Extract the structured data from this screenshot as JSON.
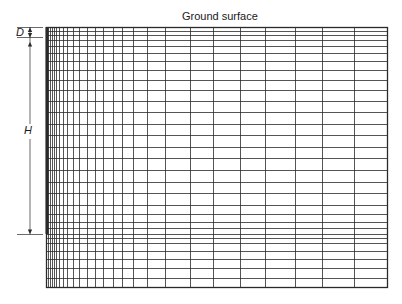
{
  "diagram": {
    "title_label": "Ground surface",
    "dimension_labels": {
      "D": "D",
      "H": "H"
    },
    "mesh": {
      "left": 46,
      "right": 387,
      "top": 27,
      "bottom": 287,
      "vertical_lines_x": [
        48,
        50,
        52,
        54,
        56,
        59,
        63,
        67,
        73,
        79,
        87,
        95,
        103,
        113,
        122,
        133,
        147,
        165,
        190,
        213,
        240,
        265,
        295,
        322,
        354
      ],
      "horizontal_lines_y": [
        31,
        35,
        40,
        46,
        53,
        61,
        70,
        80,
        90,
        101,
        112,
        124,
        135,
        147,
        158,
        170,
        182,
        193,
        205,
        214,
        222,
        228,
        234,
        238,
        243,
        251,
        259,
        268,
        278
      ],
      "line_color": "#2a2a2a",
      "pile": {
        "x": 46,
        "y_top": 27,
        "y_bottom": 234,
        "width": 3
      }
    },
    "dimensions": {
      "D": {
        "x": 30,
        "y_top": 27,
        "y_bottom": 37
      },
      "H": {
        "x": 30,
        "y_top": 37,
        "y_bottom": 234,
        "label_gap": [
          124,
          139
        ]
      }
    }
  }
}
